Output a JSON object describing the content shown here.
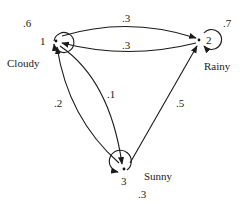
{
  "diagram": {
    "type": "markov-chain",
    "nodes": [
      {
        "id": "1",
        "label": "Cloudy",
        "number": "1",
        "self_prob": ".6"
      },
      {
        "id": "2",
        "label": "Rainy",
        "number": "2",
        "self_prob": ".7"
      },
      {
        "id": "3",
        "label": "Sunny",
        "number": "3",
        "self_prob": ".3"
      }
    ],
    "edges": [
      {
        "from": "1",
        "to": "2",
        "prob": ".3"
      },
      {
        "from": "2",
        "to": "1",
        "prob": ".3"
      },
      {
        "from": "1",
        "to": "3",
        "prob": ".1"
      },
      {
        "from": "3",
        "to": "1",
        "prob": ".2"
      },
      {
        "from": "3",
        "to": "2",
        "prob": ".5"
      }
    ]
  }
}
